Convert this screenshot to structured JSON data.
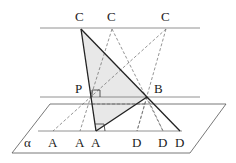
{
  "diagram": {
    "title": "",
    "labels": {
      "c1": "C",
      "c2": "C",
      "c3": "C",
      "p": "P",
      "b": "B",
      "alpha": "α",
      "a1": "A",
      "a2": "A",
      "a3": "A",
      "d1": "D",
      "d2": "D",
      "d3": "D"
    },
    "colors": {
      "line": "#333333",
      "thin_line": "#777777",
      "dashed": "#666666",
      "shade": "#e8e8e8"
    }
  }
}
